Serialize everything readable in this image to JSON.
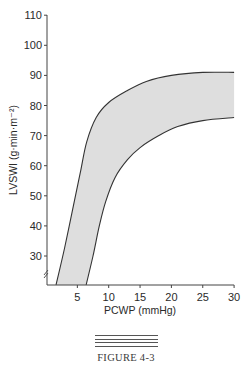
{
  "chart_data": {
    "type": "area",
    "title": "",
    "xlabel": "PCWP (mmHg)",
    "ylabel": "LVSWI (g·min·m⁻²)",
    "xlim": [
      0,
      30
    ],
    "ylim": [
      20,
      110
    ],
    "x_ticks": [
      5,
      10,
      15,
      20,
      25,
      30
    ],
    "y_ticks": [
      30,
      40,
      50,
      60,
      70,
      80,
      90,
      100,
      110
    ],
    "grid": false,
    "axis_break_y": true,
    "series": [
      {
        "name": "upper boundary",
        "points": [
          [
            1.6,
            20.4
          ],
          [
            3,
            33
          ],
          [
            4.5,
            48
          ],
          [
            5.5,
            58
          ],
          [
            6.5,
            68
          ],
          [
            8,
            76
          ],
          [
            10,
            81
          ],
          [
            13,
            85
          ],
          [
            16,
            88
          ],
          [
            20,
            90
          ],
          [
            25,
            91
          ],
          [
            30,
            91
          ]
        ]
      },
      {
        "name": "lower boundary",
        "points": [
          [
            6.4,
            20.4
          ],
          [
            7.5,
            30
          ],
          [
            8.5,
            40
          ],
          [
            9.5,
            48
          ],
          [
            11,
            56
          ],
          [
            13,
            62
          ],
          [
            15,
            66
          ],
          [
            18,
            70
          ],
          [
            21,
            73
          ],
          [
            25,
            75
          ],
          [
            30,
            76
          ]
        ]
      }
    ],
    "fill_color": "#dedede",
    "line_color": "#333333"
  },
  "figure": {
    "caption": "FIGURE 4-3"
  }
}
